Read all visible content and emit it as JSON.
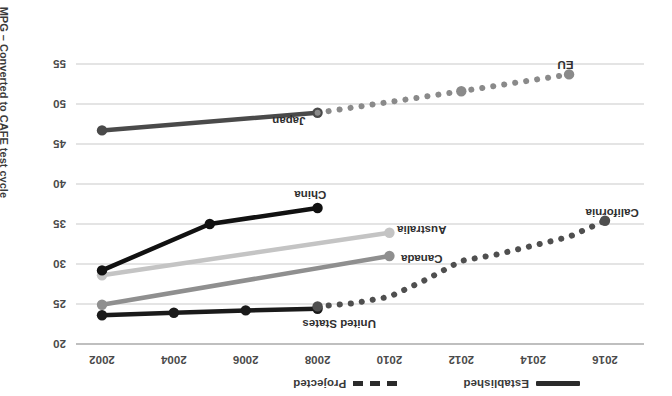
{
  "chart_data": {
    "type": "line",
    "title": "",
    "xlabel": "",
    "ylabel": "MPG – Converted to CAFE test cycle",
    "xlim": [
      2001,
      2017
    ],
    "ylim": [
      20,
      57
    ],
    "y_inverted": true,
    "grid": true,
    "rotation_deg": 180,
    "xticks": [
      2002,
      2004,
      2006,
      2008,
      2010,
      2012,
      2014,
      2016
    ],
    "yticks": [
      20,
      25,
      30,
      35,
      40,
      45,
      50,
      55
    ],
    "legend": {
      "position": "top-left",
      "entries": [
        {
          "label": "Established",
          "style": "solid"
        },
        {
          "label": "Projected",
          "style": "dashed"
        }
      ]
    },
    "series": [
      {
        "name": "United States",
        "color": "#1a1a1a",
        "style": "solid",
        "label_anchor": {
          "x": 2008.6,
          "y": 22.5
        },
        "points": [
          {
            "x": 2002,
            "y": 23.6
          },
          {
            "x": 2004,
            "y": 23.9
          },
          {
            "x": 2006,
            "y": 24.2
          },
          {
            "x": 2008,
            "y": 24.4
          }
        ]
      },
      {
        "name": "California",
        "color": "#4f4f4f",
        "style": "dashed",
        "label_anchor": {
          "x": 2016.2,
          "y": 36.4
        },
        "points": [
          {
            "x": 2008,
            "y": 24.7
          },
          {
            "x": 2009,
            "y": 25.1
          },
          {
            "x": 2010,
            "y": 25.9
          },
          {
            "x": 2011,
            "y": 28.0
          },
          {
            "x": 2012,
            "y": 30.4
          },
          {
            "x": 2013,
            "y": 31.2
          },
          {
            "x": 2014,
            "y": 32.3
          },
          {
            "x": 2015,
            "y": 33.4
          },
          {
            "x": 2016,
            "y": 35.4
          }
        ]
      },
      {
        "name": "Canada",
        "color": "#8f8f8f",
        "style": "solid",
        "label_anchor": {
          "x": 2010.9,
          "y": 30.6
        },
        "points": [
          {
            "x": 2002,
            "y": 24.9
          },
          {
            "x": 2010,
            "y": 31.0
          }
        ]
      },
      {
        "name": "Australia",
        "color": "#c4c4c4",
        "style": "solid",
        "label_anchor": {
          "x": 2010.9,
          "y": 34.3
        },
        "points": [
          {
            "x": 2002,
            "y": 28.6
          },
          {
            "x": 2010,
            "y": 33.9
          }
        ]
      },
      {
        "name": "China",
        "color": "#111111",
        "style": "solid",
        "label_anchor": {
          "x": 2007.8,
          "y": 38.6
        },
        "points": [
          {
            "x": 2002,
            "y": 29.2
          },
          {
            "x": 2005,
            "y": 35.0
          },
          {
            "x": 2008,
            "y": 37.0
          }
        ]
      },
      {
        "name": "Japan",
        "color": "#4a4a4a",
        "style": "solid",
        "label_anchor": {
          "x": 2007.2,
          "y": 47.9
        },
        "points": [
          {
            "x": 2002,
            "y": 46.7
          },
          {
            "x": 2008,
            "y": 48.9
          }
        ]
      },
      {
        "name": "EU",
        "color": "#8a8a8a",
        "style": "dashed",
        "label_anchor": {
          "x": 2014.9,
          "y": 54.9
        },
        "points": [
          {
            "x": 2008,
            "y": 48.9
          },
          {
            "x": 2012,
            "y": 51.6
          },
          {
            "x": 2015,
            "y": 53.7
          }
        ],
        "marker_points": [
          {
            "x": 2012,
            "y": 51.6
          },
          {
            "x": 2015,
            "y": 53.7
          }
        ]
      }
    ]
  }
}
